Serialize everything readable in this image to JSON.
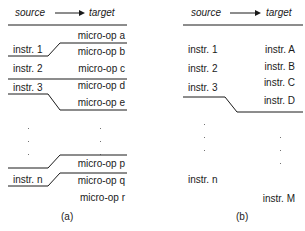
{
  "panel_a": {
    "header": {
      "source": "source",
      "target": "target"
    },
    "source_labels": [
      "instr. 1",
      "instr. 2",
      "instr. 3",
      "instr. n"
    ],
    "target_labels": [
      "micro-op a",
      "micro-op b",
      "micro-op c",
      "micro-op d",
      "micro-op e",
      "micro-op p",
      "micro-op q",
      "micro-op r"
    ],
    "caption": "(a)"
  },
  "panel_b": {
    "header": {
      "source": "source",
      "target": "target"
    },
    "source_labels": [
      "instr. 1",
      "instr. 2",
      "instr. 3",
      "instr. n"
    ],
    "target_labels": [
      "instr. A",
      "instr. B",
      "instr. C",
      "instr. D",
      "instr. M"
    ],
    "caption": "(b)"
  },
  "colors": {
    "line": "#1a1a1a",
    "text": "#1a1a1a"
  }
}
